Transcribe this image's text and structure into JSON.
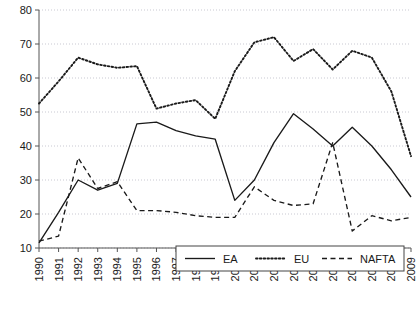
{
  "chart_data": {
    "type": "line",
    "title": "",
    "subtitle": "",
    "xlabel": "",
    "ylabel": "",
    "x": [
      1990,
      1991,
      1992,
      1993,
      1994,
      1995,
      1996,
      1997,
      1998,
      1999,
      2000,
      2001,
      2002,
      2003,
      2004,
      2005,
      2006,
      2007,
      2008,
      2009
    ],
    "categories": [
      "1990",
      "1991",
      "1992",
      "1993",
      "1994",
      "1995",
      "1996",
      "1997",
      "1998",
      "1999",
      "2000",
      "2001",
      "2002",
      "2003",
      "2004",
      "2005",
      "2006",
      "2007",
      "2008",
      "2009"
    ],
    "xlim": [
      1990,
      2009
    ],
    "ylim": [
      10,
      80
    ],
    "yticks": [
      10,
      20,
      30,
      40,
      50,
      60,
      70,
      80
    ],
    "grid": true,
    "grid_style": "dotted",
    "legend_position": "bottom-center",
    "series": [
      {
        "name": "EA",
        "style": "solid",
        "color": "#1a1a1a",
        "values": [
          11.5,
          20.5,
          30.0,
          27.0,
          29.0,
          46.5,
          47.0,
          44.5,
          43.0,
          42.0,
          24.0,
          30.0,
          41.0,
          49.5,
          45.0,
          40.0,
          45.5,
          40.0,
          33.0,
          25.0
        ]
      },
      {
        "name": "EU",
        "style": "dotted",
        "color": "#1a1a1a",
        "values": [
          52.5,
          59.0,
          66.0,
          64.0,
          63.0,
          63.5,
          51.0,
          52.5,
          53.5,
          48.0,
          62.0,
          70.5,
          72.0,
          65.0,
          68.5,
          62.5,
          68.0,
          66.0,
          56.0,
          37.0
        ]
      },
      {
        "name": "NAFTA",
        "style": "dashed",
        "color": "#1a1a1a",
        "values": [
          12.0,
          13.5,
          36.5,
          27.5,
          29.5,
          21.0,
          21.0,
          20.5,
          19.5,
          19.0,
          19.0,
          28.0,
          24.0,
          22.5,
          23.0,
          41.0,
          15.0,
          19.5,
          18.0,
          19.0
        ]
      }
    ]
  },
  "legend": {
    "items": [
      {
        "label": "EA",
        "style": "solid"
      },
      {
        "label": "EU",
        "style": "dotted"
      },
      {
        "label": "NAFTA",
        "style": "dashed"
      }
    ]
  },
  "axes": {
    "y_tick_labels": [
      "80",
      "70",
      "60",
      "50",
      "40",
      "30",
      "20",
      "10"
    ],
    "x_tick_labels": [
      "1990",
      "1991",
      "1992",
      "1993",
      "1994",
      "1995",
      "1996",
      "1997",
      "1998",
      "1999",
      "2000",
      "2001",
      "2002",
      "2003",
      "2004",
      "2005",
      "2006",
      "2007",
      "2008",
      "2009"
    ]
  }
}
